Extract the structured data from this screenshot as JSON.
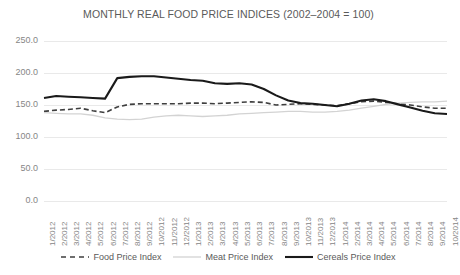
{
  "chart_data": {
    "type": "line",
    "title": "MONTHLY REAL FOOD PRICE INDICES (2002–2004 = 100)",
    "xlabel": "",
    "ylabel": "",
    "ylim": [
      0,
      250
    ],
    "yticks": [
      "0.0",
      "50.0",
      "100.0",
      "150.0",
      "200.0",
      "250.0"
    ],
    "ytick_values": [
      0,
      50,
      100,
      150,
      200,
      250
    ],
    "grid": true,
    "legend_position": "bottom",
    "categories": [
      "1/2012",
      "2/2012",
      "3/2012",
      "4/2012",
      "5/2012",
      "6/2012",
      "7/2012",
      "8/2012",
      "9/2012",
      "10/2012",
      "11/2012",
      "12/2012",
      "1/2013",
      "2/2013",
      "3/2013",
      "4/2013",
      "5/2013",
      "6/2013",
      "7/2013",
      "8/2013",
      "9/2013",
      "10/2013",
      "11/2013",
      "12/2013",
      "1/2014",
      "2/2014",
      "3/2014",
      "4/2014",
      "5/2014",
      "6/2014",
      "7/2014",
      "8/2014",
      "9/2014",
      "10/2014"
    ],
    "series": [
      {
        "name": "Food Price Index",
        "style": "dashed",
        "color": "#3f3f3f",
        "width": 1.6,
        "values": [
          140,
          142,
          143,
          145,
          141,
          138,
          147,
          151,
          152,
          152,
          152,
          152,
          153,
          153,
          152,
          153,
          154,
          155,
          154,
          150,
          151,
          152,
          151,
          150,
          149,
          152,
          155,
          156,
          154,
          152,
          150,
          147,
          145,
          145
        ]
      },
      {
        "name": "Meat Price Index",
        "style": "solid",
        "color": "#d3d3d3",
        "width": 1.3,
        "values": [
          138,
          137,
          136,
          136,
          134,
          130,
          128,
          127,
          128,
          131,
          133,
          134,
          133,
          132,
          133,
          134,
          136,
          137,
          138,
          139,
          140,
          140,
          139,
          139,
          140,
          142,
          145,
          148,
          151,
          153,
          154,
          155,
          155,
          156
        ]
      },
      {
        "name": "Cereals Price Index",
        "style": "solid",
        "color": "#1a1a1a",
        "width": 2.1,
        "values": [
          161,
          164,
          163,
          162,
          161,
          160,
          192,
          194,
          195,
          195,
          193,
          191,
          189,
          188,
          184,
          183,
          184,
          182,
          175,
          165,
          157,
          153,
          152,
          150,
          148,
          152,
          157,
          159,
          156,
          151,
          146,
          141,
          137,
          136
        ]
      }
    ]
  },
  "legend": {
    "items": [
      {
        "label": "Food Price Index"
      },
      {
        "label": "Meat Price Index"
      },
      {
        "label": "Cereals Price Index"
      }
    ]
  }
}
